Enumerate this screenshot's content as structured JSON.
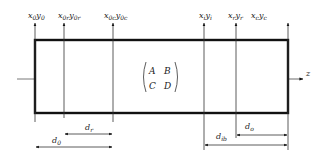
{
  "diagram": {
    "type": "optical-system-schematic",
    "matrix": {
      "label": "transfer-matrix",
      "a": "A",
      "b": "B",
      "c": "C",
      "d": "D"
    },
    "axis": {
      "label": "z"
    },
    "input_planes": [
      {
        "base": "x",
        "sub1": "0",
        "base2": "y",
        "sub2": "0"
      },
      {
        "base": "x",
        "sub1": "0r",
        "base2": "y",
        "sub2": "0r"
      },
      {
        "base": "x",
        "sub1": "0c",
        "base2": "y",
        "sub2": "0c"
      }
    ],
    "output_planes": [
      {
        "base": "x",
        "sub1": "i",
        "base2": "y",
        "sub2": "i"
      },
      {
        "base": "x",
        "sub1": "r",
        "base2": "y",
        "sub2": "r"
      },
      {
        "base": "x",
        "sub1": "c",
        "base2": "y",
        "sub2": "c"
      }
    ],
    "dimensions": [
      {
        "base": "d",
        "sub": "r"
      },
      {
        "base": "d",
        "sub": "0"
      },
      {
        "base": "d",
        "sub": "ib"
      },
      {
        "base": "d",
        "sub": "o"
      }
    ]
  },
  "colors": {
    "line": "#111111",
    "thin": "#444444",
    "text": "#222222"
  }
}
